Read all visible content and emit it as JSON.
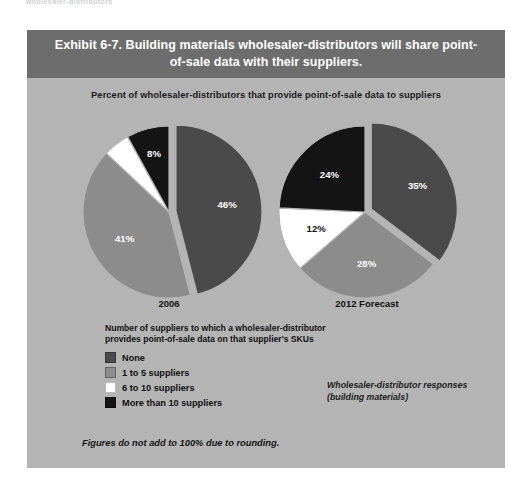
{
  "scan": {
    "top_cropped_text": "wholesaler-distributors"
  },
  "exhibit": {
    "header_title": "Exhibit 6-7. Building materials wholesaler-distributors will share point-of-sale data with their suppliers.",
    "subtitle": "Percent of wholesaler-distributors that provide point-of-sale data to suppliers",
    "source_note_line1": "Wholesaler-distributor responses",
    "source_note_line2": "(building materials)",
    "footnote": "Figures do not add to 100% due to rounding."
  },
  "legend": {
    "title_line1": "Number of suppliers to which a wholesaler-distributor",
    "title_line2": "provides point-of-sale data on that supplier's SKUs",
    "items": [
      {
        "label": "None",
        "color": "#4a4a4a"
      },
      {
        "label": "1 to 5 suppliers",
        "color": "#8c8c8c"
      },
      {
        "label": "6 to 10 suppliers",
        "color": "#ffffff"
      },
      {
        "label": "More than 10 suppliers",
        "color": "#141414"
      }
    ]
  },
  "colors": {
    "panel_background": "#b4b4b4",
    "header_background": "#6d6d6d",
    "header_text": "#ffffff",
    "none": "#4a4a4a",
    "one_to_five": "#8c8c8c",
    "six_to_ten": "#ffffff",
    "more_than_ten": "#141414"
  },
  "chart_data": {
    "type": "pie",
    "title": "Exhibit 6-7. Building materials wholesaler-distributors will share point-of-sale data with their suppliers.",
    "subtitle": "Percent of wholesaler-distributors that provide point-of-sale data to suppliers",
    "unit": "percent",
    "categories": [
      "None",
      "1 to 5 suppliers",
      "6 to 10 suppliers",
      "More than 10 suppliers"
    ],
    "category_colors": [
      "#4a4a4a",
      "#8c8c8c",
      "#ffffff",
      "#141414"
    ],
    "legend_position": "bottom-left",
    "note": "Figures do not add to 100% due to rounding.",
    "charts": [
      {
        "name": "2006",
        "label": "2006",
        "exploded_slice": "None",
        "start_angle_deg": 0,
        "slices": [
          {
            "category": "None",
            "value": 46,
            "label": "46%",
            "color": "#4a4a4a",
            "label_color": "#ffffff"
          },
          {
            "category": "1 to 5 suppliers",
            "value": 41,
            "label": "41%",
            "color": "#8c8c8c",
            "label_color": "#ffffff"
          },
          {
            "category": "6 to 10 suppliers",
            "value": 5,
            "label": "5%",
            "color": "#ffffff",
            "label_color": "#ffffff"
          },
          {
            "category": "More than 10 suppliers",
            "value": 8,
            "label": "8%",
            "color": "#141414",
            "label_color": "#ffffff"
          }
        ]
      },
      {
        "name": "2012 Forecast",
        "label": "2012 Forecast",
        "exploded_slice": "None",
        "start_angle_deg": 0,
        "slices": [
          {
            "category": "None",
            "value": 35,
            "label": "35%",
            "color": "#4a4a4a",
            "label_color": "#ffffff"
          },
          {
            "category": "1 to 5 suppliers",
            "value": 28,
            "label": "28%",
            "color": "#8c8c8c",
            "label_color": "#ffffff"
          },
          {
            "category": "6 to 10 suppliers",
            "value": 12,
            "label": "12%",
            "color": "#ffffff",
            "label_color": "#111111"
          },
          {
            "category": "More than 10 suppliers",
            "value": 24,
            "label": "24%",
            "color": "#141414",
            "label_color": "#ffffff"
          }
        ]
      }
    ]
  }
}
